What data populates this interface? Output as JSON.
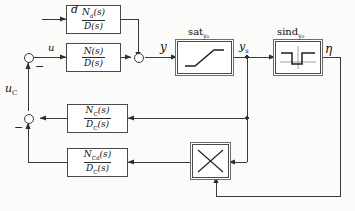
{
  "diagram": {
    "signals": {
      "d": "d",
      "u": "u",
      "y": "y",
      "ys": "y",
      "ys_sub": "s",
      "eta": "η",
      "uc": "u",
      "uc_sub": "C"
    },
    "blocks": [
      {
        "id": "nd-over-d",
        "name": "disturbance-transfer-block",
        "numerator": "N",
        "numerator_sub": "d",
        "numerator_arg": "(s)",
        "denominator": "D",
        "denominator_sub": "",
        "denominator_arg": "(s)"
      },
      {
        "id": "n-over-d",
        "name": "plant-transfer-block",
        "numerator": "N",
        "numerator_sub": "",
        "numerator_arg": "(s)",
        "denominator": "D",
        "denominator_sub": "",
        "denominator_arg": "(s)"
      },
      {
        "id": "nc-over-dc",
        "name": "controller-transfer-block",
        "numerator": "N",
        "numerator_sub": "C",
        "numerator_arg": "(s)",
        "denominator": "D",
        "denominator_sub": "C",
        "denominator_arg": "(s)"
      },
      {
        "id": "ncd-over-dc",
        "name": "disturbance-controller-transfer-block",
        "numerator": "N",
        "numerator_sub": "Cd",
        "numerator_arg": "(s)",
        "denominator": "D",
        "denominator_sub": "C",
        "denominator_arg": "(s)"
      }
    ],
    "nonlinear": {
      "saturation": {
        "name": "saturation-block",
        "label": "sat",
        "label_sub": "y₀",
        "characteristic": "saturation-curve"
      },
      "sind": {
        "name": "sind-block",
        "label": "sind",
        "label_sub": "y₀",
        "characteristic": "notch-curve"
      },
      "multiplier": {
        "name": "multiplier-block",
        "label": "",
        "characteristic": "cross-multiplier"
      }
    },
    "summing_junctions": [
      {
        "name": "summing-junction-u",
        "signs": [
          "-"
        ]
      },
      {
        "name": "summing-junction-uc",
        "signs": [
          "-"
        ]
      },
      {
        "name": "summing-junction-y",
        "signs": []
      }
    ],
    "signs": {
      "minus": "−"
    },
    "colors": {
      "line": "#3a3a3a",
      "block_border": "#4a4a4a",
      "background": "#fbfbf9",
      "text": "#111111"
    }
  }
}
